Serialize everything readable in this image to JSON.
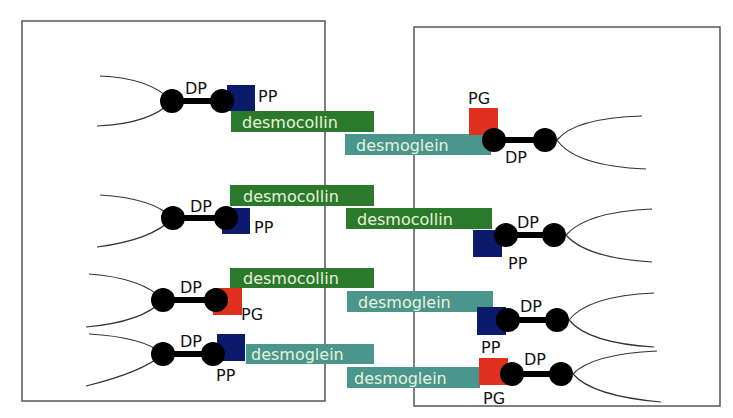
{
  "diagram": {
    "colors": {
      "desmocollin": "#2b7a2b",
      "desmoglein": "#4a958c",
      "PP": "#0c1a6b",
      "PG": "#e0301e",
      "DP": "#000000",
      "cell_border": "#555555",
      "bar_text": "#e8f3dc"
    },
    "cells": [
      {
        "name": "left-cell",
        "x": 22,
        "y": 21,
        "w": 303,
        "h": 380
      },
      {
        "name": "right-cell",
        "x": 414,
        "y": 27,
        "w": 306,
        "h": 379
      }
    ],
    "rows": [
      {
        "left": {
          "dp_label": "DP",
          "plaque": "PP",
          "plaque_label": "PP"
        },
        "left_bar": {
          "label": "desmocollin",
          "type": "desmocollin"
        },
        "right_bar": {
          "label": "desmoglein",
          "type": "desmoglein"
        },
        "right": {
          "dp_label": "DP",
          "plaque": "PG",
          "plaque_label": "PG"
        }
      },
      {
        "left": {
          "dp_label": "DP",
          "plaque": "PP",
          "plaque_label": "PP"
        },
        "left_bar": {
          "label": "desmocollin",
          "type": "desmocollin"
        },
        "right_bar": {
          "label": "desmocollin",
          "type": "desmocollin"
        },
        "right": {
          "dp_label": "DP",
          "plaque": "PP",
          "plaque_label": "PP"
        }
      },
      {
        "left": {
          "dp_label": "DP",
          "plaque": "PG",
          "plaque_label": "PG"
        },
        "left_bar": {
          "label": "desmocollin",
          "type": "desmocollin"
        },
        "right_bar": {
          "label": "desmoglein",
          "type": "desmoglein"
        },
        "right": {
          "dp_label": "DP",
          "plaque": "PP",
          "plaque_label": "PP"
        }
      },
      {
        "left": {
          "dp_label": "DP",
          "plaque": "PP",
          "plaque_label": "PP"
        },
        "left_bar": {
          "label": "desmoglein",
          "type": "desmoglein"
        },
        "right_bar": {
          "label": "desmoglein",
          "type": "desmoglein"
        },
        "right": {
          "dp_label": "DP",
          "plaque": "PG",
          "plaque_label": "PG"
        }
      }
    ]
  }
}
